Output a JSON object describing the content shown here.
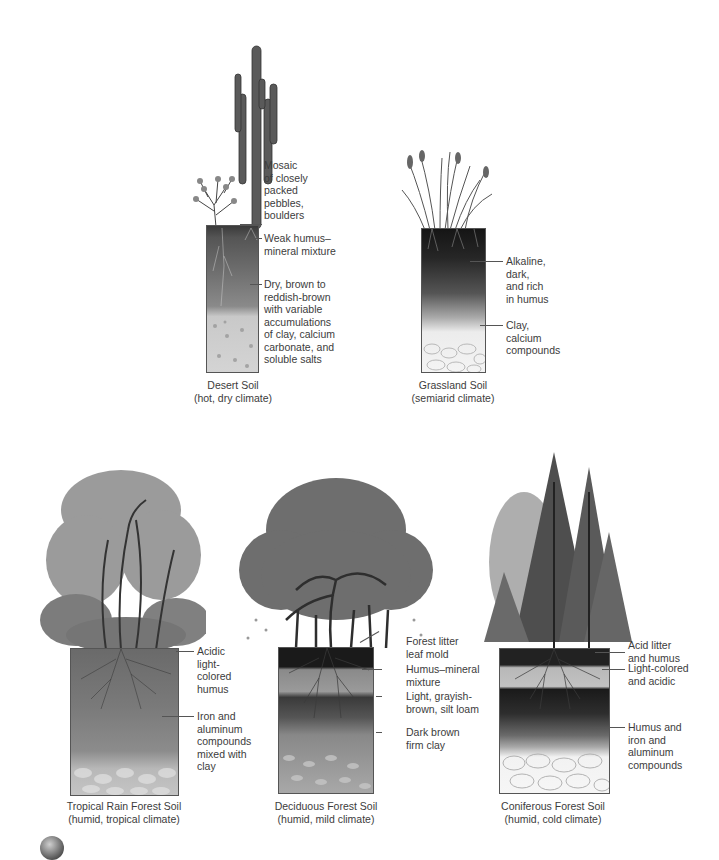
{
  "figure": {
    "profiles": [
      {
        "id": "desert",
        "caption": "Desert Soil",
        "subcaption": "(hot, dry climate)",
        "vegetation": "saguaro cactus and shrub",
        "layers": [
          "Mosaic\nof closely\npacked\npebbles,\nboulders",
          "Weak humus–\nmineral mixture",
          "Dry, brown to\nreddish-brown\nwith variable\naccumulations\nof clay, calcium\ncarbonate, and\nsoluble salts"
        ]
      },
      {
        "id": "grassland",
        "caption": "Grassland Soil",
        "subcaption": "(semiarid climate)",
        "vegetation": "tall grasses",
        "layers": [
          "Alkaline,\ndark,\nand rich\nin humus",
          "Clay,\ncalcium\ncompounds"
        ]
      },
      {
        "id": "tropical",
        "caption": "Tropical Rain Forest Soil",
        "subcaption": "(humid, tropical climate)",
        "vegetation": "rain forest trees with vines",
        "layers": [
          "Acidic\nlight-\ncolored\nhumus",
          "Iron and\naluminum\ncompounds\nmixed with\nclay"
        ]
      },
      {
        "id": "deciduous",
        "caption": "Deciduous Forest Soil",
        "subcaption": "(humid, mild climate)",
        "vegetation": "broadleaf deciduous trees",
        "layers": [
          "Forest litter\nleaf mold",
          "Humus–mineral\nmixture",
          "Light, grayish-\nbrown, silt loam",
          "Dark brown\nfirm clay"
        ]
      },
      {
        "id": "coniferous",
        "caption": "Coniferous Forest Soil",
        "subcaption": "(humid, cold climate)",
        "vegetation": "conifer trees",
        "layers": [
          "Acid litter\nand humus",
          "Light-colored\nand acidic",
          "Humus and\niron and\naluminum\ncompounds"
        ]
      }
    ],
    "colors": {
      "ink": "#3c3c3c",
      "leader": "#555555",
      "soil_dark": "#2a2a2a",
      "soil_mid": "#7a7a7a",
      "soil_light": "#d8d8d8",
      "foliage": "#707070"
    }
  }
}
